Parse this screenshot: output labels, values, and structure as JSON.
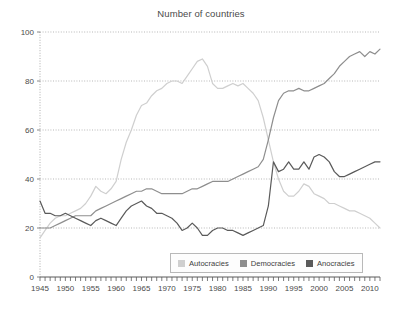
{
  "chart_data": {
    "type": "line",
    "title": "Number of countries",
    "xlabel": "",
    "ylabel": "",
    "xlim": [
      1945,
      2012
    ],
    "ylim": [
      0,
      100
    ],
    "yticks": [
      0,
      20,
      40,
      60,
      80,
      100
    ],
    "xticks": [
      1945,
      1950,
      1955,
      1960,
      1965,
      1970,
      1975,
      1980,
      1985,
      1990,
      1995,
      2000,
      2005,
      2010
    ],
    "xtick_minor_step": 1,
    "grid": "horizontal-dotted",
    "legend_position": "bottom-right-inside",
    "x": [
      1945,
      1946,
      1947,
      1948,
      1949,
      1950,
      1951,
      1952,
      1953,
      1954,
      1955,
      1956,
      1957,
      1958,
      1959,
      1960,
      1961,
      1962,
      1963,
      1964,
      1965,
      1966,
      1967,
      1968,
      1969,
      1970,
      1971,
      1972,
      1973,
      1974,
      1975,
      1976,
      1977,
      1978,
      1979,
      1980,
      1981,
      1982,
      1983,
      1984,
      1985,
      1986,
      1987,
      1988,
      1989,
      1990,
      1991,
      1992,
      1993,
      1994,
      1995,
      1996,
      1997,
      1998,
      1999,
      2000,
      2001,
      2002,
      2003,
      2004,
      2005,
      2006,
      2007,
      2008,
      2009,
      2010,
      2011,
      2012
    ],
    "series": [
      {
        "name": "Autocracies",
        "color": "#cfcfcf",
        "values": [
          16,
          19,
          22,
          24,
          25,
          25,
          26,
          27,
          28,
          30,
          33,
          37,
          35,
          34,
          36,
          39,
          48,
          55,
          60,
          66,
          70,
          71,
          74,
          76,
          77,
          79,
          80,
          80,
          79,
          82,
          85,
          88,
          89,
          86,
          79,
          77,
          77,
          78,
          79,
          78,
          79,
          77,
          75,
          72,
          65,
          56,
          47,
          40,
          35,
          33,
          33,
          35,
          38,
          37,
          34,
          33,
          32,
          30,
          30,
          29,
          28,
          27,
          27,
          26,
          25,
          24,
          22,
          20
        ]
      },
      {
        "name": "Democracies",
        "color": "#8e8e8e",
        "values": [
          20,
          20,
          20,
          21,
          22,
          23,
          24,
          25,
          25,
          25,
          25,
          27,
          28,
          29,
          30,
          31,
          32,
          33,
          34,
          35,
          35,
          36,
          36,
          35,
          34,
          34,
          34,
          34,
          34,
          35,
          36,
          36,
          37,
          38,
          39,
          39,
          39,
          39,
          40,
          41,
          42,
          43,
          44,
          45,
          48,
          56,
          65,
          72,
          75,
          76,
          76,
          77,
          76,
          76,
          77,
          78,
          79,
          81,
          83,
          86,
          88,
          90,
          91,
          92,
          90,
          92,
          91,
          93
        ]
      },
      {
        "name": "Anocracies",
        "color": "#5a5a5a",
        "values": [
          31,
          26,
          26,
          25,
          25,
          26,
          25,
          24,
          23,
          22,
          21,
          23,
          24,
          23,
          22,
          21,
          24,
          27,
          29,
          30,
          31,
          29,
          28,
          26,
          26,
          25,
          24,
          22,
          19,
          20,
          22,
          20,
          17,
          17,
          19,
          20,
          20,
          19,
          19,
          18,
          17,
          18,
          19,
          20,
          21,
          29,
          47,
          43,
          44,
          47,
          44,
          44,
          47,
          44,
          49,
          50,
          49,
          47,
          43,
          41,
          41,
          42,
          43,
          44,
          45,
          46,
          47,
          47
        ]
      }
    ]
  },
  "legend": {
    "items": [
      {
        "label": "Autocracies",
        "color": "#cfcfcf"
      },
      {
        "label": "Democracies",
        "color": "#8e8e8e"
      },
      {
        "label": "Anocracies",
        "color": "#5a5a5a"
      }
    ]
  }
}
